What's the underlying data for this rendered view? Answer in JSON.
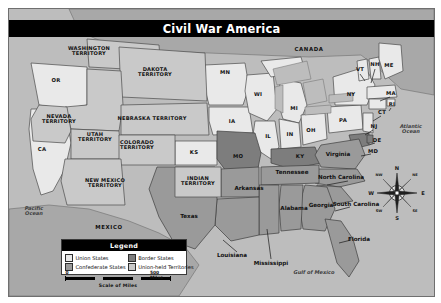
{
  "figure": {
    "title": "Civil War America",
    "accent_color": "#000000",
    "land_union": "#e9e9e9",
    "land_confederate": "#9a9a9a",
    "land_border": "#7d7d7d",
    "land_territory": "#c9c9c9",
    "water_color": "#bdbdbd",
    "foreign_color": "#a8a8a8"
  },
  "legend": {
    "title": "Legend",
    "items": [
      {
        "label": "Union States",
        "color": "#e9e9e9"
      },
      {
        "label": "Border States",
        "color": "#7d7d7d"
      },
      {
        "label": "Confederate States",
        "color": "#9a9a9a"
      },
      {
        "label": "Union-held Territories",
        "color": "#c9c9c9"
      }
    ]
  },
  "scale": {
    "caption": "Scale of Miles",
    "start_label": "0",
    "end_label": "500 Miles"
  },
  "compass": {
    "north": "N",
    "south": "S",
    "east": "E",
    "west": "W",
    "northwest": "NW",
    "northeast": "NE",
    "southwest": "SW",
    "southeast": "SE"
  },
  "map_labels": {
    "territories": [
      {
        "name": "washington-territory",
        "text": "WASHINGTON\nTERRITORY",
        "x": 80,
        "y": 42
      },
      {
        "name": "dakota-territory",
        "text": "DAKOTA\nTERRITORY",
        "x": 146,
        "y": 63
      },
      {
        "name": "nevada-territory",
        "text": "NEVADA\nTERRITORY",
        "x": 50,
        "y": 110
      },
      {
        "name": "utah-territory",
        "text": "UTAH\nTERRITORY",
        "x": 86,
        "y": 128
      },
      {
        "name": "colorado-territory",
        "text": "COLORADO\nTERRITORY",
        "x": 128,
        "y": 136
      },
      {
        "name": "nebraska-territory",
        "text": "NEBRASKA TERRITORY",
        "x": 143,
        "y": 110
      },
      {
        "name": "new-mexico-territory",
        "text": "NEW MEXICO\nTERRITORY",
        "x": 96,
        "y": 174
      },
      {
        "name": "indian-territory",
        "text": "INDIAN\nTERRITORY",
        "x": 189,
        "y": 172
      }
    ],
    "state_abbr": [
      {
        "name": "oregon",
        "text": "OR",
        "x": 47,
        "y": 72
      },
      {
        "name": "california",
        "text": "CA",
        "x": 33,
        "y": 141
      },
      {
        "name": "minnesota",
        "text": "MN",
        "x": 216,
        "y": 64
      },
      {
        "name": "iowa",
        "text": "IA",
        "x": 223,
        "y": 113
      },
      {
        "name": "kansas",
        "text": "KS",
        "x": 185,
        "y": 144
      },
      {
        "name": "missouri",
        "text": "MO",
        "x": 229,
        "y": 148
      },
      {
        "name": "wisconsin",
        "text": "WI",
        "x": 249,
        "y": 86
      },
      {
        "name": "michigan",
        "text": "MI",
        "x": 285,
        "y": 100
      },
      {
        "name": "illinois",
        "text": "IL",
        "x": 259,
        "y": 128
      },
      {
        "name": "indiana",
        "text": "IN",
        "x": 281,
        "y": 126
      },
      {
        "name": "ohio",
        "text": "OH",
        "x": 302,
        "y": 122
      },
      {
        "name": "pennsylvania",
        "text": "PA",
        "x": 334,
        "y": 112
      },
      {
        "name": "new-york",
        "text": "NY",
        "x": 342,
        "y": 86
      },
      {
        "name": "vermont",
        "text": "VT",
        "x": 351,
        "y": 61
      },
      {
        "name": "new-hampshire",
        "text": "NH",
        "x": 366,
        "y": 56
      },
      {
        "name": "maine",
        "text": "ME",
        "x": 380,
        "y": 57
      },
      {
        "name": "massachusetts",
        "text": "MA",
        "x": 382,
        "y": 85
      },
      {
        "name": "rhode-island",
        "text": "RI",
        "x": 383,
        "y": 96
      },
      {
        "name": "connecticut",
        "text": "CT",
        "x": 373,
        "y": 104
      },
      {
        "name": "new-jersey",
        "text": "NJ",
        "x": 365,
        "y": 118
      },
      {
        "name": "delaware",
        "text": "DE",
        "x": 368,
        "y": 132
      },
      {
        "name": "maryland",
        "text": "MD",
        "x": 364,
        "y": 143
      },
      {
        "name": "kentucky",
        "text": "KY",
        "x": 291,
        "y": 148
      }
    ],
    "states_named": [
      {
        "name": "virginia",
        "text": "Virginia",
        "x": 329,
        "y": 146
      },
      {
        "name": "north-carolina",
        "text": "North Carolina",
        "x": 332,
        "y": 169
      },
      {
        "name": "south-carolina",
        "text": "South Carolina",
        "x": 347,
        "y": 196
      },
      {
        "name": "georgia",
        "text": "Georgia",
        "x": 312,
        "y": 197
      },
      {
        "name": "tennessee",
        "text": "Tennessee",
        "x": 283,
        "y": 164
      },
      {
        "name": "alabama",
        "text": "Alabama",
        "x": 285,
        "y": 200
      },
      {
        "name": "arkansas",
        "text": "Arkansas",
        "x": 240,
        "y": 180
      },
      {
        "name": "mississippi",
        "text": "Mississippi",
        "x": 262,
        "y": 255
      },
      {
        "name": "louisiana",
        "text": "Louisiana",
        "x": 223,
        "y": 247
      },
      {
        "name": "texas",
        "text": "Texas",
        "x": 180,
        "y": 208
      },
      {
        "name": "florida",
        "text": "Florida",
        "x": 350,
        "y": 231
      }
    ],
    "countries": [
      {
        "name": "canada",
        "text": "CANADA",
        "x": 300,
        "y": 41
      },
      {
        "name": "mexico",
        "text": "MEXICO",
        "x": 100,
        "y": 219
      }
    ],
    "waters": [
      {
        "name": "pacific-ocean",
        "text": "Pacific\nOcean",
        "x": 25,
        "y": 202
      },
      {
        "name": "atlantic-ocean",
        "text": "Atlantic\nOcean",
        "x": 402,
        "y": 120
      },
      {
        "name": "gulf-of-mexico",
        "text": "Gulf of Mexico",
        "x": 305,
        "y": 264
      }
    ]
  }
}
